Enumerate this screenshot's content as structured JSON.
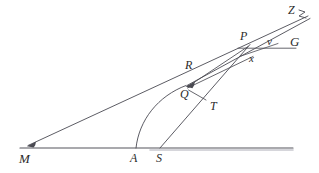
{
  "figure": {
    "kind": "geometry-diagram",
    "background_color": "#ffffff",
    "stroke_color": "#4a4a52",
    "label_color": "#2b2b2b",
    "width": 319,
    "height": 173,
    "points": [
      {
        "id": "M",
        "label": "M",
        "x": 30,
        "y": 148,
        "label_x": 19,
        "label_y": 152,
        "font_size": 13
      },
      {
        "id": "A",
        "label": "A",
        "x": 136,
        "y": 148,
        "label_x": 130,
        "label_y": 152,
        "font_size": 12
      },
      {
        "id": "S",
        "label": "S",
        "x": 161,
        "y": 148,
        "label_x": 156,
        "label_y": 152,
        "font_size": 12
      },
      {
        "id": "T",
        "label": "T",
        "x": 207,
        "y": 99,
        "label_x": 210,
        "label_y": 100,
        "font_size": 12
      },
      {
        "id": "Q",
        "label": "Q",
        "x": 187,
        "y": 87,
        "label_x": 180,
        "label_y": 88,
        "font_size": 12
      },
      {
        "id": "R",
        "label": "R",
        "x": 192,
        "y": 76,
        "label_x": 185,
        "label_y": 59,
        "font_size": 12
      },
      {
        "id": "x",
        "label": "x",
        "x": 250,
        "y": 52,
        "label_x": 249,
        "label_y": 53,
        "font_size": 11
      },
      {
        "id": "P",
        "label": "P",
        "x": 246,
        "y": 47,
        "label_x": 240,
        "label_y": 30,
        "font_size": 12
      },
      {
        "id": "V",
        "label": "v",
        "x": 270,
        "y": 47,
        "label_x": 267,
        "label_y": 36,
        "font_size": 11
      },
      {
        "id": "G",
        "label": "G",
        "x": 300,
        "y": 47,
        "label_x": 290,
        "label_y": 35,
        "font_size": 13
      },
      {
        "id": "Z",
        "label": "Z",
        "x": 306,
        "y": 14,
        "label_x": 288,
        "label_y": 4,
        "font_size": 12
      }
    ],
    "segments": [
      {
        "name": "baseline-M-to-right",
        "from": "M",
        "to": "right-edge",
        "x1": 20,
        "y1": 148,
        "x2": 293,
        "y2": 148,
        "weight": 1.1
      },
      {
        "name": "ray-M-to-Z",
        "from": "M",
        "to": "Z",
        "x1": 28,
        "y1": 145,
        "x2": 308,
        "y2": 16,
        "weight": 0.9
      },
      {
        "name": "ray-Q-to-Z",
        "from": "Q",
        "to": "Z",
        "x1": 187,
        "y1": 86,
        "x2": 310,
        "y2": 19,
        "weight": 0.9
      },
      {
        "name": "ray-Q-to-P",
        "from": "Q",
        "to": "P",
        "x1": 187,
        "y1": 87,
        "x2": 247,
        "y2": 47,
        "weight": 0.9
      },
      {
        "name": "ray-Q-to-x",
        "from": "Q",
        "to": "x",
        "x1": 187,
        "y1": 88,
        "x2": 252,
        "y2": 57,
        "weight": 0.9
      },
      {
        "name": "segment-Q-to-T",
        "from": "Q",
        "to": "T",
        "x1": 188,
        "y1": 90,
        "x2": 206,
        "y2": 100,
        "weight": 0.9
      },
      {
        "name": "ray-S-through-T-to-P",
        "from": "S",
        "to": "P",
        "x1": 160,
        "y1": 148,
        "x2": 249,
        "y2": 45,
        "weight": 0.9
      },
      {
        "name": "horizontal-P-to-G",
        "from": "P",
        "to": "G",
        "x1": 239,
        "y1": 48,
        "x2": 296,
        "y2": 48,
        "weight": 0.9
      },
      {
        "name": "short-ray-below-P",
        "from": "x",
        "to": "V",
        "x1": 243,
        "y1": 55,
        "x2": 276,
        "y2": 44,
        "weight": 0.8
      }
    ],
    "arcs": [
      {
        "name": "arc-A-to-Q",
        "from": "A",
        "to": "Q",
        "x1": 136,
        "y1": 148,
        "cx": 149,
        "cy": 104,
        "x2": 186,
        "y2": 85,
        "weight": 0.9
      }
    ],
    "arrowheads": [
      {
        "name": "arrowhead-at-M-end",
        "x": 29,
        "y": 145,
        "angle_deg": 205
      },
      {
        "name": "arrowhead-at-Q",
        "x": 187,
        "y": 87,
        "angle_deg": 200
      }
    ]
  }
}
